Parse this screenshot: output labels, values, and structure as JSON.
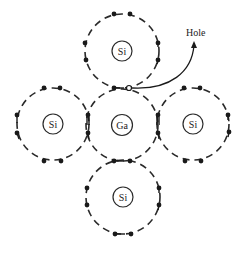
{
  "diagram": {
    "title": "",
    "atoms": [
      {
        "id": "top",
        "label": "Si",
        "cx": 122,
        "cy": 51
      },
      {
        "id": "left",
        "label": "Si",
        "cx": 53,
        "cy": 124
      },
      {
        "id": "center",
        "label": "Ga",
        "cx": 122,
        "cy": 125
      },
      {
        "id": "right",
        "label": "Si",
        "cx": 193,
        "cy": 124
      },
      {
        "id": "bottom",
        "label": "Si",
        "cx": 123,
        "cy": 197
      }
    ],
    "hole_label": "Hole",
    "colors": {
      "line": "#2a2a2a",
      "electron": "#1a1a1a",
      "background": "#ffffff"
    }
  }
}
